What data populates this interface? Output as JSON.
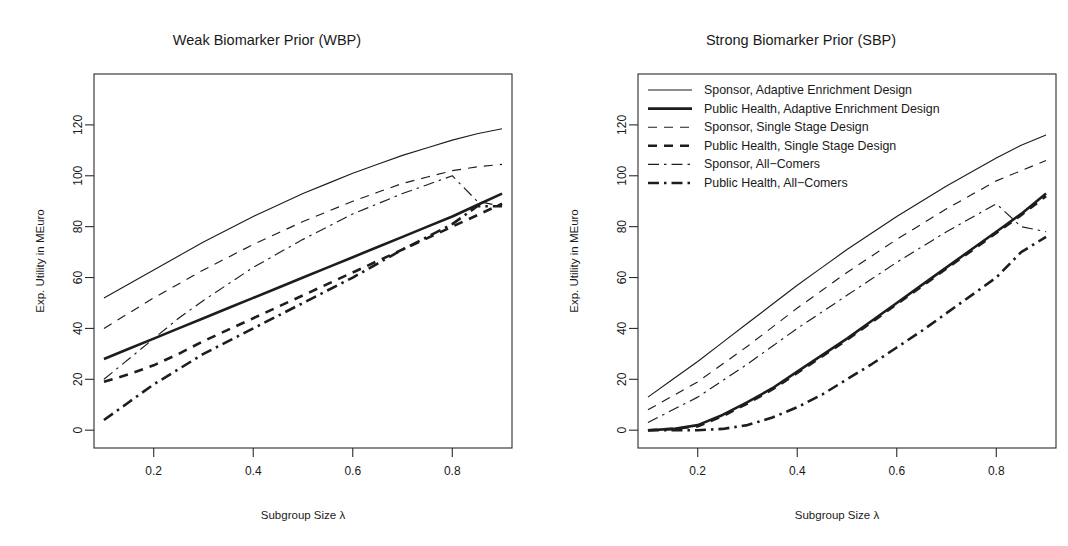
{
  "figure": {
    "width": 1068,
    "height": 546,
    "background": "#ffffff",
    "ink_color": "#1d1d1d"
  },
  "axes": {
    "xlabel": "Subgroup Size λ",
    "ylabel": "Exp. Utility in MEuro",
    "xticks": [
      0.2,
      0.4,
      0.6,
      0.8
    ],
    "xtick_labels": [
      "0.2",
      "0.4",
      "0.6",
      "0.8"
    ],
    "yticks": [
      0,
      20,
      40,
      60,
      80,
      100,
      120
    ],
    "ytick_labels": [
      "0",
      "20",
      "40",
      "60",
      "80",
      "100",
      "120"
    ],
    "xlim": [
      0.08,
      0.92
    ],
    "ylim": [
      -7,
      140
    ],
    "grid": false
  },
  "legend": {
    "position": "top-left-inside-right-panel",
    "entries": [
      {
        "label": "Sponsor, Adaptive Enrichment Design",
        "style": "solid",
        "width": "thin",
        "dash": "none"
      },
      {
        "label": "Public Health, Adaptive Enrichment Design",
        "style": "solid",
        "width": "thick",
        "dash": "none"
      },
      {
        "label": "Sponsor, Single Stage Design",
        "style": "dashed",
        "width": "thin",
        "dash": "8 7"
      },
      {
        "label": "Public Health, Single Stage Design",
        "style": "dashed",
        "width": "thick",
        "dash": "8 7"
      },
      {
        "label": "Sponsor, All−Comers",
        "style": "dashdot",
        "width": "thin",
        "dash": "10 5 2 5"
      },
      {
        "label": "Public Health, All−Comers",
        "style": "dashdot",
        "width": "thick",
        "dash": "10 5 2 5"
      }
    ]
  },
  "chart_data": [
    {
      "type": "line",
      "panel": "left",
      "title": "Weak Biomarker Prior (WBP)",
      "xlabel": "Subgroup Size λ",
      "ylabel": "Exp. Utility in MEuro",
      "xlim": [
        0.08,
        0.92
      ],
      "ylim": [
        -7,
        140
      ],
      "grid": false,
      "x": [
        0.1,
        0.15,
        0.2,
        0.25,
        0.3,
        0.35,
        0.4,
        0.45,
        0.5,
        0.55,
        0.6,
        0.65,
        0.7,
        0.75,
        0.8,
        0.85,
        0.9
      ],
      "series": [
        {
          "name": "Sponsor, Adaptive Enrichment Design",
          "style": "solid",
          "width": "thin",
          "values": [
            52,
            57.5,
            63,
            68.5,
            74,
            79,
            84,
            88.5,
            93,
            97,
            101,
            104.5,
            108,
            111,
            114,
            116.5,
            118.5
          ]
        },
        {
          "name": "Public Health, Adaptive Enrichment Design",
          "style": "solid",
          "width": "thick",
          "values": [
            28,
            32,
            36,
            40,
            44,
            48,
            52,
            56,
            60,
            64,
            68,
            72,
            76,
            80,
            84,
            88.5,
            93
          ]
        },
        {
          "name": "Sponsor, Single Stage Design",
          "style": "dashed",
          "width": "thin",
          "values": [
            40,
            46,
            52,
            57.5,
            63,
            68,
            73,
            77.5,
            82,
            86,
            90,
            93.5,
            97,
            99.5,
            102,
            103.5,
            104.5
          ]
        },
        {
          "name": "Public Health, Single Stage Design",
          "style": "dashed",
          "width": "thick",
          "values": [
            19,
            22,
            25.5,
            30,
            35,
            39.5,
            44,
            48.5,
            53,
            57.5,
            62,
            66.5,
            71,
            75.5,
            80,
            84.5,
            89
          ]
        },
        {
          "name": "Sponsor, All−Comers",
          "style": "dashdot",
          "width": "thin",
          "values": [
            20,
            28,
            36,
            44,
            51,
            57.5,
            64,
            69.5,
            75,
            80,
            85,
            89,
            93,
            96.5,
            100,
            90,
            88
          ]
        },
        {
          "name": "Public Health, All−Comers",
          "style": "dashdot",
          "width": "thick",
          "values": [
            4,
            11,
            18,
            24,
            30,
            35,
            40,
            45,
            50,
            55,
            60,
            65.5,
            71,
            76,
            81,
            88,
            88
          ]
        }
      ]
    },
    {
      "type": "line",
      "panel": "right",
      "title": "Strong Biomarker Prior (SBP)",
      "xlabel": "Subgroup Size λ",
      "ylabel": "Exp. Utility in MEuro",
      "xlim": [
        0.08,
        0.92
      ],
      "ylim": [
        -7,
        140
      ],
      "grid": false,
      "x": [
        0.1,
        0.15,
        0.2,
        0.25,
        0.3,
        0.35,
        0.4,
        0.45,
        0.5,
        0.55,
        0.6,
        0.65,
        0.7,
        0.75,
        0.8,
        0.85,
        0.9
      ],
      "series": [
        {
          "name": "Sponsor, Adaptive Enrichment Design",
          "style": "solid",
          "width": "thin",
          "values": [
            13,
            20,
            27,
            34.5,
            42,
            49.5,
            57,
            64,
            71,
            77.5,
            84,
            90,
            96,
            101.5,
            107,
            112,
            116
          ]
        },
        {
          "name": "Public Health, Adaptive Enrichment Design",
          "style": "solid",
          "width": "thick",
          "values": [
            0,
            0.5,
            2,
            6,
            11,
            16.5,
            23,
            29.5,
            36,
            43,
            50,
            57,
            64,
            71,
            78,
            85,
            93
          ]
        },
        {
          "name": "Sponsor, Single Stage Design",
          "style": "dashed",
          "width": "thin",
          "values": [
            8,
            13.5,
            19,
            26,
            33,
            40.5,
            48,
            55,
            62,
            68.5,
            75,
            81,
            87,
            92.5,
            98,
            102,
            106
          ]
        },
        {
          "name": "Public Health, Single Stage Design",
          "style": "dashed",
          "width": "thick",
          "values": [
            0,
            0.5,
            1.5,
            5.5,
            10.5,
            16,
            22.5,
            29,
            35.5,
            42.5,
            49.5,
            56.5,
            63.5,
            70.5,
            77.5,
            84.5,
            92
          ]
        },
        {
          "name": "Sponsor, All−Comers",
          "style": "dashdot",
          "width": "thin",
          "values": [
            3,
            8,
            13,
            19.5,
            26,
            33,
            40,
            46.5,
            53,
            59.5,
            66,
            72,
            78,
            83.5,
            89,
            80,
            78
          ]
        },
        {
          "name": "Public Health, All−Comers",
          "style": "dashdot",
          "width": "thick",
          "values": [
            0,
            0,
            0,
            0.5,
            2,
            5,
            9,
            14,
            20,
            26,
            32.5,
            39,
            46,
            53,
            60,
            70,
            76
          ]
        }
      ]
    }
  ]
}
